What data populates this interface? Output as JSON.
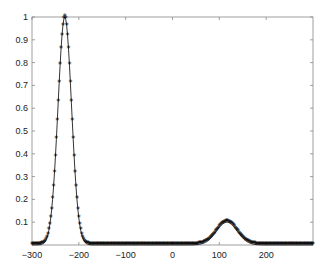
{
  "chart_data": {
    "type": "line",
    "title": "",
    "xlabel": "",
    "ylabel": "",
    "xlim": [
      -300,
      300
    ],
    "ylim": [
      0,
      1
    ],
    "grid": false,
    "legend": null,
    "marker": "*",
    "x_ticks": [
      -300,
      -200,
      -100,
      0,
      100,
      200
    ],
    "x_tick_labels": [
      "-300",
      "-200",
      "-100",
      "0",
      "100",
      "200"
    ],
    "y_ticks": [
      0.1,
      0.2,
      0.3,
      0.4,
      0.5,
      0.6,
      0.7,
      0.8,
      0.9,
      1
    ],
    "y_tick_labels": [
      "0.1",
      "0.2",
      "0.3",
      "0.4",
      "0.5",
      "0.6",
      "0.7",
      "0.8",
      "0.9",
      "1"
    ],
    "series": [
      {
        "name": "signal",
        "description": "Sum of two Gaussian peaks sampled every 2 units",
        "components": [
          {
            "center": -230,
            "amplitude": 1.0,
            "sigma": 14.5
          },
          {
            "center": 116,
            "amplitude": 0.1,
            "sigma": 22
          }
        ],
        "x_range": [
          -300,
          300
        ],
        "x_step": 2,
        "color": "#000000"
      }
    ]
  }
}
